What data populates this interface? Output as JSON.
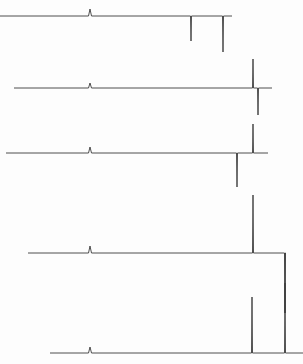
{
  "figure": {
    "title": "",
    "background_color": "#fdfdfd",
    "trace_color": "#3a3a3a",
    "width": 303,
    "height": 364
  },
  "chart_data": {
    "type": "line",
    "title": "",
    "subtitle": "",
    "xlabel": "",
    "ylabel": "",
    "xlim": [
      0,
      303
    ],
    "ylim": [
      364,
      0
    ],
    "grid": false,
    "legend": "none",
    "series": [
      {
        "name": "trace-1",
        "baseline_y": 16,
        "x_start": 0,
        "x_end": 232,
        "peaks": [
          {
            "x": 90,
            "direction": "up",
            "height": 7,
            "width": 3,
            "label": ""
          },
          {
            "x": 191,
            "direction": "down",
            "height": 25,
            "width": 1,
            "label": ""
          },
          {
            "x": 223,
            "direction": "down",
            "height": 36,
            "width": 1,
            "label": ""
          }
        ]
      },
      {
        "name": "trace-2",
        "baseline_y": 88,
        "x_start": 14,
        "x_end": 272,
        "peaks": [
          {
            "x": 90,
            "direction": "up",
            "height": 5,
            "width": 3,
            "label": ""
          },
          {
            "x": 253,
            "direction": "up",
            "height": 29,
            "width": 1,
            "label": ""
          },
          {
            "x": 258,
            "direction": "down",
            "height": 27,
            "width": 1,
            "label": ""
          }
        ]
      },
      {
        "name": "trace-3",
        "baseline_y": 153,
        "x_start": 6,
        "x_end": 268,
        "peaks": [
          {
            "x": 90,
            "direction": "up",
            "height": 6,
            "width": 3,
            "label": ""
          },
          {
            "x": 237,
            "direction": "down",
            "height": 34,
            "width": 1,
            "label": ""
          },
          {
            "x": 253,
            "direction": "up",
            "height": 29,
            "width": 1,
            "label": ""
          }
        ]
      },
      {
        "name": "trace-4",
        "baseline_y": 253,
        "x_start": 28,
        "x_end": 285,
        "peaks": [
          {
            "x": 90,
            "direction": "up",
            "height": 7,
            "width": 3,
            "label": ""
          },
          {
            "x": 253,
            "direction": "up",
            "height": 58,
            "width": 1,
            "label": ""
          },
          {
            "x": 285,
            "direction": "down",
            "height": 60,
            "width": 1,
            "label": ""
          }
        ]
      },
      {
        "name": "trace-5",
        "baseline_y": 353,
        "x_start": 50,
        "x_end": 303,
        "peaks": [
          {
            "x": 90,
            "direction": "up",
            "height": 6,
            "width": 3,
            "label": ""
          },
          {
            "x": 252,
            "direction": "up",
            "height": 56,
            "width": 1,
            "label": ""
          },
          {
            "x": 285,
            "direction": "up",
            "height": 70,
            "width": 1,
            "label": ""
          }
        ]
      }
    ]
  }
}
